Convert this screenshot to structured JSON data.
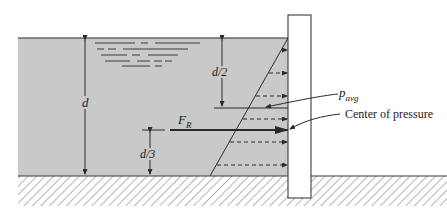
{
  "diagram": {
    "labels": {
      "depth": "d",
      "half_depth": "d/2",
      "third_depth": "d/3",
      "resultant_force_main": "F",
      "resultant_force_sub": "R",
      "avg_pressure_main": "p",
      "avg_pressure_sub": "avg",
      "center_of_pressure": "Center of pressure"
    },
    "colors": {
      "water": "#c9c9c9",
      "wall_fill": "#ffffff",
      "line": "#2a2a2a",
      "hatch": "#555555",
      "background": "#ffffff"
    },
    "pressure_arrows_y": [
      50,
      73,
      96,
      119,
      142,
      165
    ],
    "avg_pressure_line_y": 108,
    "resultant_y": 130
  }
}
